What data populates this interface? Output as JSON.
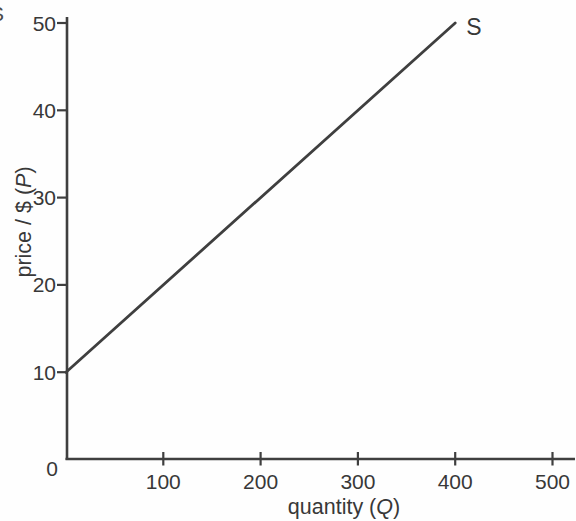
{
  "edge_fragment": {
    "glyph": "S"
  },
  "chart_data": {
    "type": "line",
    "title": "",
    "xlabel": "quantity (Q)",
    "ylabel": "price / $ (P)",
    "xlim": [
      0,
      523
    ],
    "ylim": [
      0,
      50
    ],
    "x_ticks": [
      100,
      200,
      300,
      400,
      500
    ],
    "y_ticks": [
      10,
      20,
      30,
      40,
      50
    ],
    "origin_label": "0",
    "grid": false,
    "legend_position": "none",
    "series": [
      {
        "name": "S",
        "label": "S",
        "description": "supply curve, P = 10 + 0.1*Q",
        "points": [
          [
            0,
            10
          ],
          [
            400,
            50
          ]
        ],
        "color": "#3f3f3f"
      }
    ]
  },
  "style": {
    "axis_color": "#3f3f3f",
    "tick_color": "#3f3f3f",
    "text_color": "#383838",
    "background": "#fefefe"
  }
}
